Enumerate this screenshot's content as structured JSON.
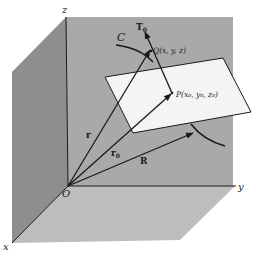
{
  "figure": {
    "colors": {
      "background": "#ffffff",
      "back_wall": "#a9a9a9",
      "left_wall": "#8e8e8e",
      "floor": "#bdbdbd",
      "plane": "#f4f4f4",
      "ink": "#1a1a1a"
    },
    "axes": {
      "x": "x",
      "y": "y",
      "z": "z",
      "origin": "O"
    },
    "curve_label": "C",
    "points": {
      "P": "P(x₀, y₀, z₀)",
      "Q": "Q(x, y, z)"
    },
    "vectors": {
      "r": "r",
      "r0_base": "r",
      "r0_sub": "0",
      "R": "R",
      "T0_base": "T",
      "T0_sub": "0"
    }
  }
}
